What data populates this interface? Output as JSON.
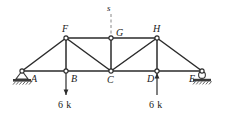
{
  "figure": {
    "type": "truss-diagram",
    "colors": {
      "member": "#2b2b2b",
      "joint_fill": "#ffffff",
      "joint_stroke": "#2b2b2b",
      "support": "#3a3a3a",
      "section_line": "#7a7a7a",
      "text": "#1a1a1a",
      "background": "#ffffff"
    }
  },
  "joints": {
    "A": {
      "label": "A",
      "x": 22,
      "y": 71,
      "label_x": 31,
      "label_y": 74
    },
    "B": {
      "label": "B",
      "x": 66,
      "y": 71,
      "label_x": 71,
      "label_y": 74
    },
    "C": {
      "label": "C",
      "x": 111,
      "y": 71,
      "label_x": 107,
      "label_y": 75
    },
    "D": {
      "label": "D",
      "x": 157,
      "y": 71,
      "label_x": 147,
      "label_y": 74
    },
    "E": {
      "label": "E",
      "x": 202,
      "y": 71,
      "label_x": 189,
      "label_y": 74
    },
    "F": {
      "label": "F",
      "x": 66,
      "y": 38,
      "label_x": 62,
      "label_y": 24
    },
    "G": {
      "label": "G",
      "x": 111,
      "y": 38,
      "label_x": 116,
      "label_y": 28
    },
    "H": {
      "label": "H",
      "x": 157,
      "y": 38,
      "label_x": 153,
      "label_y": 24
    }
  },
  "members": {
    "bottom_chord": [
      "A-B",
      "B-C",
      "C-D",
      "D-E"
    ],
    "top_chord": [
      "F-G",
      "G-H"
    ],
    "end_diagonals": [
      "A-F",
      "H-E"
    ],
    "inner_diagonals": [
      "F-C",
      "C-H"
    ],
    "verticals": [
      "B-F",
      "C-G",
      "D-H"
    ]
  },
  "supports": {
    "A": {
      "type": "pin",
      "name": "pin-support"
    },
    "E": {
      "type": "roller",
      "name": "roller-support"
    }
  },
  "loads": [
    {
      "joint": "B",
      "magnitude": "6 k",
      "direction": "down",
      "x": 66,
      "tail_y": 71,
      "head_y": 95,
      "label_x": 58,
      "label_y": 100
    },
    {
      "joint": "D",
      "magnitude": "6 k",
      "direction": "up",
      "x": 157,
      "tail_y": 95,
      "head_y": 73,
      "label_x": 149,
      "label_y": 100
    }
  ],
  "section": {
    "label": "s",
    "label_x": 107,
    "label_y": 4,
    "line_x": 111,
    "line_top_y": 14,
    "line_bottom_y": 38,
    "style": "dashed"
  }
}
